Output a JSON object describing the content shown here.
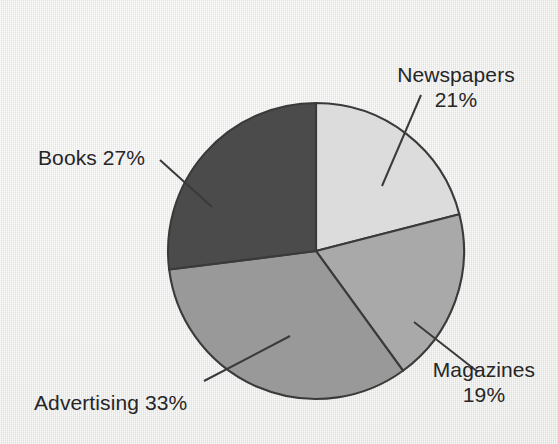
{
  "chart_data": {
    "type": "pie",
    "title": "",
    "subtitle": "",
    "xlabel": "",
    "ylabel": "",
    "legend_position": "none",
    "grid": false,
    "start_angle_deg": 0,
    "direction": "clockwise",
    "categories": [
      "Newspapers",
      "Magazines",
      "Advertising",
      "Books"
    ],
    "values": [
      21,
      19,
      33,
      27
    ],
    "value_unit": "%",
    "total": 100,
    "slices": [
      {
        "name": "Newspapers",
        "value": 21,
        "percent_text": "21%",
        "label_line1": "Newspapers",
        "label_line2": "21%",
        "color": "#dcdcdc",
        "start_deg": 0,
        "end_deg": 75.6
      },
      {
        "name": "Magazines",
        "value": 19,
        "percent_text": "19%",
        "label_line1": "Magazines",
        "label_line2": "19%",
        "color": "#a9a9a9",
        "start_deg": 75.6,
        "end_deg": 144.0
      },
      {
        "name": "Advertising",
        "value": 33,
        "percent_text": "33%",
        "label_line1": "Advertising 33%",
        "label_line2": "",
        "color": "#999999",
        "start_deg": 144.0,
        "end_deg": 262.8
      },
      {
        "name": "Books",
        "value": 27,
        "percent_text": "27%",
        "label_line1": "Books 27%",
        "label_line2": "",
        "color": "#4b4b4b",
        "start_deg": 262.8,
        "end_deg": 360.0
      }
    ]
  },
  "colors": {
    "background": "#eeeeec",
    "outline": "#3a3a3a",
    "text": "#262626",
    "leader_line": "#3a3a3a"
  }
}
